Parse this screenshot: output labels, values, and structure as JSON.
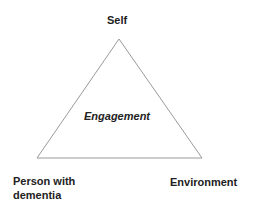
{
  "diagram": {
    "center_label": "Engagement",
    "vertices": {
      "top": "Self",
      "bottom_left_line1": "Person with",
      "bottom_left_line2": "dementia",
      "bottom_right": "Environment"
    },
    "stroke_color": "#9a9a9a",
    "text_color": "#222222"
  }
}
